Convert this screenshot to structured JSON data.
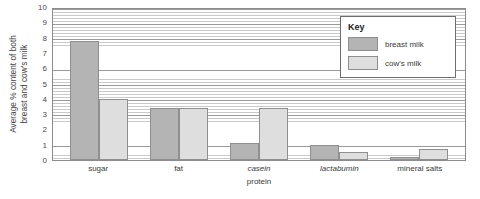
{
  "chart_data": {
    "type": "bar",
    "title": "",
    "xlabel": "protein",
    "ylabel_lines": [
      "Average % content of both",
      "breast and cow's milk"
    ],
    "ylabel": "Average % content of both breast and cow's milk",
    "ylim": [
      0,
      10
    ],
    "yticks": [
      10,
      9,
      8,
      7,
      6,
      5,
      4,
      3,
      2,
      1,
      0
    ],
    "grid": true,
    "grid_orientation": "horizontal",
    "legend_position": "top-right",
    "legend_title": "Key",
    "categories": [
      "sugar",
      "fat",
      "casein",
      "lactabumin",
      "mineral salts"
    ],
    "categories_italic": [
      false,
      false,
      true,
      true,
      false
    ],
    "series": [
      {
        "name": "breast milk",
        "color": "#b4b4b4",
        "values": [
          7.8,
          3.4,
          1.1,
          1.0,
          0.2
        ]
      },
      {
        "name": "cow's milk",
        "color": "#dedede",
        "values": [
          4.0,
          3.4,
          3.4,
          0.5,
          0.7
        ]
      }
    ]
  },
  "colors": {
    "breast_milk": "#b4b4b4",
    "cow_milk": "#dedede",
    "axis": "#8c8c8c",
    "gridline": "#c9c9c9",
    "text": "#3a3a3a"
  }
}
